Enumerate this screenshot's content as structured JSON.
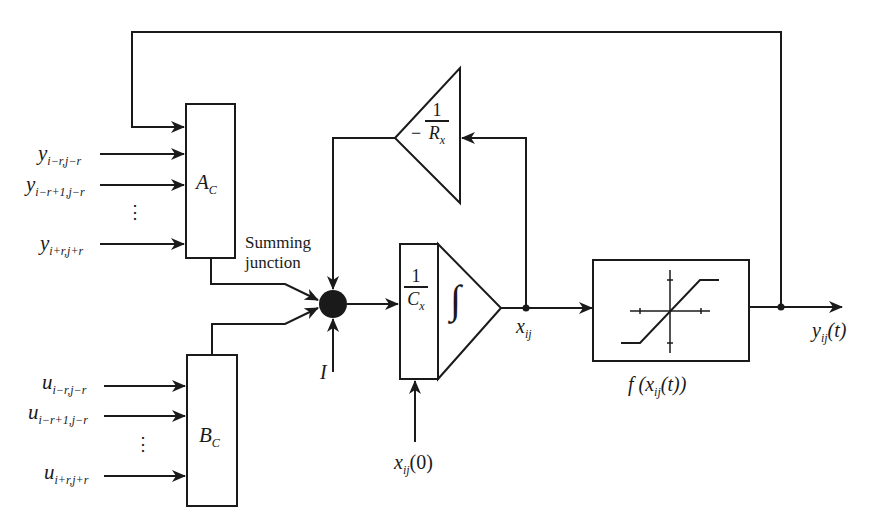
{
  "diagram": {
    "type": "block-diagram"
  },
  "inputs_y": [
    {
      "base": "y",
      "sub": "i−r,j−r"
    },
    {
      "base": "y",
      "sub": "i−r+1,j−r"
    },
    {
      "base": "y",
      "sub": "i+r,j+r"
    }
  ],
  "inputs_u": [
    {
      "base": "u",
      "sub": "i−r,j−r"
    },
    {
      "base": "u",
      "sub": "i−r+1,j−r"
    },
    {
      "base": "u",
      "sub": "i+r,j+r"
    }
  ],
  "ellipsis": "⋮",
  "blocks": {
    "a": {
      "base": "A",
      "sub": "C"
    },
    "b": {
      "base": "B",
      "sub": "C"
    },
    "integrator": {
      "num": "1",
      "den": "C",
      "den_sub": "x",
      "symbol": "∫"
    },
    "feedback_gain": {
      "sign": "−",
      "num": "1",
      "den": "R",
      "den_sub": "x"
    },
    "nonlinearity_label": {
      "prefix": "f (x",
      "sub": "ij",
      "suffix": "(t))"
    }
  },
  "labels": {
    "summing_junction_line1": "Summing",
    "summing_junction_line2": "junction",
    "bias": "I",
    "state": {
      "base": "x",
      "sub": "ij"
    },
    "initial_state": {
      "base": "x",
      "sub": "ij",
      "suffix": "(0)"
    },
    "output": {
      "base": "y",
      "sub": "ij",
      "suffix": "(t)"
    }
  },
  "colors": {
    "stroke": "#1a1a1a",
    "background": "#ffffff"
  }
}
